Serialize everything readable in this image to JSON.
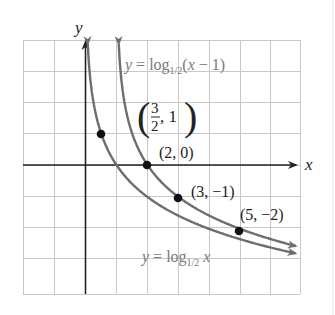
{
  "figure": {
    "x_axis_label": "x",
    "y_axis_label": "y",
    "curve_labels": {
      "shifted": {
        "prefix": "y = log",
        "base": "1/2",
        "arg": "(x − 1)"
      },
      "base": {
        "prefix": "y = log",
        "base": "1/2",
        "arg": " x"
      }
    },
    "point_labels": [
      "(2, 0)",
      "(3, −1)",
      "(5, −2)"
    ],
    "fraction_point": {
      "num": "3",
      "den": "2",
      "rest": ", 1"
    },
    "colors": {
      "grid": "#c8c8c8",
      "axis": "#222222",
      "curve": "#6e6e6e",
      "label_gray": "#7a7a7a",
      "point": "#111111"
    }
  },
  "chart_data": {
    "type": "line",
    "title": "",
    "xlabel": "x",
    "ylabel": "y",
    "xlim": [
      -2,
      7
    ],
    "ylim": [
      -4,
      4
    ],
    "grid": true,
    "legend": "inline labels",
    "series": [
      {
        "name": "y = log_{1/2}(x − 1)",
        "function": "log_{1/2}(x-1)",
        "points": [
          [
            1.5,
            1
          ],
          [
            2,
            0
          ],
          [
            3,
            -1
          ],
          [
            5,
            -2
          ]
        ]
      },
      {
        "name": "y = log_{1/2} x",
        "function": "log_{1/2}(x)",
        "points": [
          [
            0.5,
            1
          ],
          [
            1,
            0
          ],
          [
            2,
            -1
          ],
          [
            4,
            -2
          ]
        ]
      }
    ],
    "annotations": [
      "(3/2, 1)",
      "(2, 0)",
      "(3, −1)",
      "(5, −2)"
    ]
  }
}
